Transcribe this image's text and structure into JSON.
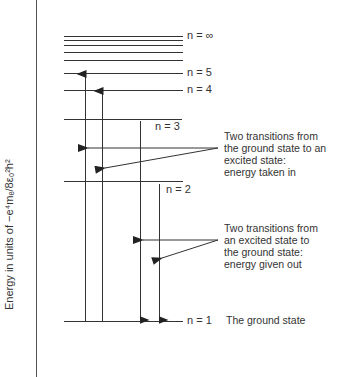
{
  "diagram": {
    "y_axis_label": "Energy in units of −e⁴mₑ/8ε₀²h²",
    "levels": [
      {
        "name": "n = ∞",
        "y": 36
      },
      {
        "name": "n = 5",
        "y": 73
      },
      {
        "name": "n = 4",
        "y": 90
      },
      {
        "name": "n = 3",
        "y": 119
      },
      {
        "name": "n = 2",
        "y": 181
      },
      {
        "name": "n = 1",
        "y": 321
      }
    ],
    "level_labels": {
      "n_inf": "n = ∞",
      "n5": "n = 5",
      "n4": "n = 4",
      "n3": "n = 3",
      "n2": "n = 2",
      "n1": "n = 1"
    },
    "ground_state_label": "The ground state",
    "annotation_absorption": {
      "lines": [
        "Two transitions from",
        "the ground state to an",
        "excited state:",
        "energy taken in"
      ]
    },
    "annotation_emission": {
      "lines": [
        "Two transitions from",
        "an excited state to",
        "the ground state:",
        "energy given out"
      ]
    },
    "transitions": [
      {
        "from": "n = 1",
        "to": "n = 5",
        "direction": "up",
        "type": "absorption"
      },
      {
        "from": "n = 1",
        "to": "n = 4",
        "direction": "up",
        "type": "absorption"
      },
      {
        "from": "n = 3",
        "to": "n = 1",
        "direction": "down",
        "type": "emission"
      },
      {
        "from": "n = 2",
        "to": "n = 1",
        "direction": "down",
        "type": "emission"
      }
    ]
  }
}
